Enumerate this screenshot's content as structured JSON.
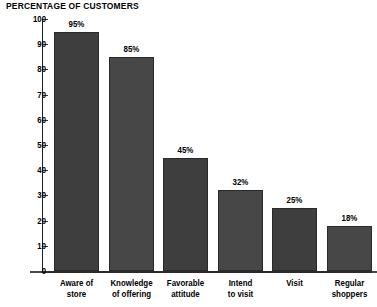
{
  "chart_data": {
    "type": "bar",
    "title": "PERCENTAGE OF CUSTOMERS",
    "xlabel": "",
    "ylabel": "",
    "ylim": [
      0,
      100
    ],
    "ytick_step": 10,
    "yticks": [
      "100",
      "90",
      "80",
      "70",
      "60",
      "50",
      "40",
      "30",
      "20",
      "10",
      "0"
    ],
    "grid": false,
    "legend": "none",
    "categories": [
      "Aware of\nstore",
      "Knowledge\nof offering",
      "Favorable\nattitude",
      "Intend\nto visit",
      "Visit",
      "Regular\nshoppers"
    ],
    "values": [
      95,
      85,
      45,
      32,
      25,
      18
    ],
    "data_labels": [
      "95%",
      "85%",
      "45%",
      "32%",
      "25%",
      "18%"
    ],
    "colors": {
      "background": "#ffffff",
      "bar_fill": "#3e3e3e",
      "bar_fill_alt": "#474747",
      "bar_border": "#2a2a2a",
      "axis": "#1d1d1d",
      "text": "#000000"
    }
  }
}
